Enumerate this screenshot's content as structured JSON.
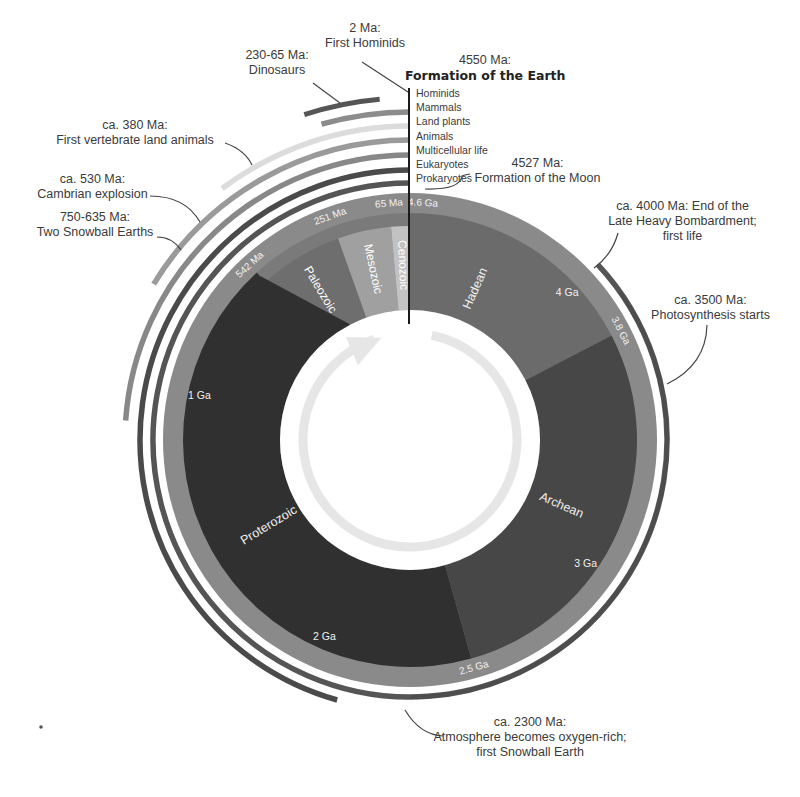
{
  "diagram": {
    "center": [
      410,
      440
    ],
    "total_ga": 4.6,
    "colors": {
      "outer_band": "#8a8a8a",
      "hadean": "#6e6e6e",
      "archean": "#4a4a4a",
      "proterozoic": "#333333",
      "phanerozoic_band": "#7a7a7a",
      "paleozoic": "#707070",
      "mesozoic": "#a3a3a3",
      "cenozoic": "#c4c4c4",
      "inner_white": "#ffffff",
      "arrow": "#e6e6e6"
    },
    "eons": [
      {
        "name": "Hadean",
        "start_ga": 4.6,
        "end_ga": 3.8,
        "color": "#6b6b6b",
        "label_at_ga": 4.3
      },
      {
        "name": "Archean",
        "start_ga": 3.8,
        "end_ga": 2.5,
        "color": "#474747",
        "label_at_ga": 3.15
      },
      {
        "name": "Proterozoic",
        "start_ga": 2.5,
        "end_ga": 0.542,
        "color": "#303030",
        "label_at_ga": 1.55
      }
    ],
    "eras": [
      {
        "name": "Paleozoic",
        "start_ga": 0.542,
        "end_ga": 0.251,
        "color": "#6e6e6e"
      },
      {
        "name": "Mesozoic",
        "start_ga": 0.251,
        "end_ga": 0.065,
        "color": "#a0a0a0"
      },
      {
        "name": "Cenozoic",
        "start_ga": 0.065,
        "end_ga": 0.0,
        "color": "#c2c2c2"
      }
    ],
    "ticks": [
      {
        "label": "4.6 Ga",
        "ga": 4.56
      },
      {
        "label": "4 Ga",
        "ga": 4.0,
        "inner": true
      },
      {
        "label": "3.8 Ga",
        "ga": 3.8
      },
      {
        "label": "3 Ga",
        "ga": 3.0,
        "inner": true
      },
      {
        "label": "2.5 Ga",
        "ga": 2.5
      },
      {
        "label": "2 Ga",
        "ga": 2.0,
        "inner": true
      },
      {
        "label": "1 Ga",
        "ga": 1.0,
        "inner": true
      },
      {
        "label": "542 Ma",
        "ga": 0.542
      },
      {
        "label": "251 Ma",
        "ga": 0.251
      },
      {
        "label": "65 Ma",
        "ga": 0.065
      }
    ],
    "life_arcs": [
      {
        "name": "Prokaryotes",
        "start_ga": 4.0,
        "r": 257,
        "color": "#555555"
      },
      {
        "name": "Eukaryotes",
        "start_ga": 2.1,
        "r": 270,
        "color": "#4a4a4a"
      },
      {
        "name": "Multicellular life",
        "start_ga": 1.1,
        "r": 285,
        "color": "#888888"
      },
      {
        "name": "Animals",
        "start_ga": 0.75,
        "r": 300,
        "color": "#9a9a9a"
      },
      {
        "name": "Land plants",
        "start_ga": 0.47,
        "r": 314,
        "color": "#dcdcdc"
      },
      {
        "name": "Mammals",
        "start_ga": 0.2,
        "r": 328,
        "color": "#8c8c8c"
      },
      {
        "name": "Hominids",
        "start_ga": 0.01,
        "r": 342,
        "color": "#555555"
      }
    ],
    "event_arcs": [
      {
        "name": "Dinosaurs",
        "start_ga": 0.23,
        "end_ga": 0.065,
        "r": 342,
        "color": "#555555",
        "width": 5
      },
      {
        "name": "Late Heavy Bombardment",
        "start_ga": 3.9,
        "end_ga": 2.3,
        "r": 257,
        "color": "#4d4d4d",
        "width": 4
      }
    ]
  },
  "legend": {
    "items": [
      "Hominids",
      "Mammals",
      "Land plants",
      "Animals",
      "Multicellular life",
      "Eukaryotes",
      "Prokaryotes"
    ]
  },
  "annotations": {
    "hominids": {
      "line1": "2 Ma:",
      "line2": "First Hominids"
    },
    "dinosaurs": {
      "line1": "230-65 Ma:",
      "line2": "Dinosaurs"
    },
    "earth": {
      "line1": "4550 Ma:",
      "line2": "Formation of the Earth"
    },
    "land_animals": {
      "line1": "ca. 380 Ma:",
      "line2": "First vertebrate land animals"
    },
    "cambrian": {
      "line1": "ca. 530 Ma:",
      "line2": "Cambrian explosion"
    },
    "snowball": {
      "line1": "750-635 Ma:",
      "line2": "Two Snowball Earths"
    },
    "moon": {
      "line1": "4527 Ma:",
      "line2": "Formation of the Moon"
    },
    "bombardment": {
      "line1": "ca. 4000 Ma: End of the",
      "line2": "Late Heavy Bombardment;",
      "line3": "first life"
    },
    "photosynthesis": {
      "line1": "ca. 3500 Ma:",
      "line2": "Photosynthesis starts"
    },
    "oxygen": {
      "line1": "ca. 2300 Ma:",
      "line2": "Atmosphere becomes oxygen-rich;",
      "line3": "first Snowball Earth"
    }
  }
}
